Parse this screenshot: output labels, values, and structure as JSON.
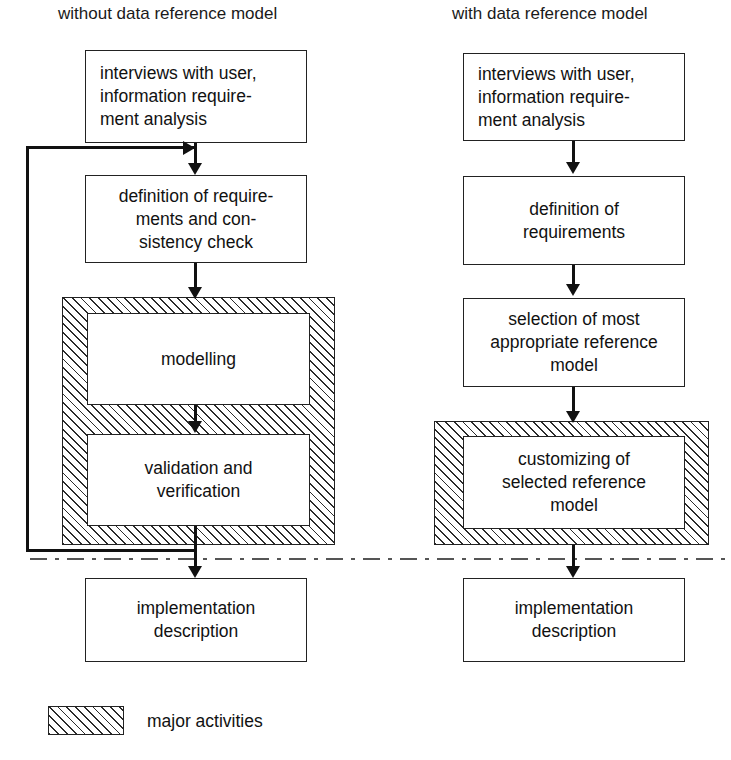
{
  "diagram": {
    "title_left": "without data reference model",
    "title_right": "with data reference model",
    "legend": {
      "swatch_name": "hatched-pattern-swatch",
      "label": "major activities"
    },
    "columns": [
      {
        "id": "without-data-reference-model",
        "header": "without data reference model",
        "nodes": [
          {
            "id": "interviews",
            "label": "interviews with user,\ninformation require-\nment analysis",
            "highlighted": false
          },
          {
            "id": "definition",
            "label": "definition of require-\nments and con-\nsistency check",
            "highlighted": false
          },
          {
            "id": "modelling",
            "label": "modelling",
            "highlighted": true
          },
          {
            "id": "validation",
            "label": "validation and\nverification",
            "highlighted": true
          },
          {
            "id": "implementation",
            "label": "implementation\ndescription",
            "highlighted": false
          }
        ],
        "feedback_loop": {
          "from": "validation",
          "to": "definition",
          "label": ""
        }
      },
      {
        "id": "with-data-reference-model",
        "header": "with data reference model",
        "nodes": [
          {
            "id": "interviews",
            "label": "interviews with user,\ninformation require-\nment analysis",
            "highlighted": false
          },
          {
            "id": "definition",
            "label": "definition of\nrequirements",
            "highlighted": false
          },
          {
            "id": "selection",
            "label": "selection of most\nappropriate reference\nmodel",
            "highlighted": false
          },
          {
            "id": "customizing",
            "label": "customizing of\nselected reference\nmodel",
            "highlighted": true
          },
          {
            "id": "implementation",
            "label": "implementation\ndescription",
            "highlighted": false
          }
        ]
      }
    ],
    "text": {
      "l_interviews_1": "interviews with user,",
      "l_interviews_2": "information require-",
      "l_interviews_3": "ment analysis",
      "l_definition_1": "definition of require-",
      "l_definition_2": "ments and con-",
      "l_definition_3": "sistency check",
      "l_modelling_1": "modelling",
      "l_validation_1": "validation and",
      "l_validation_2": "verification",
      "l_implementation_1": "implementation",
      "l_implementation_2": "description",
      "r_interviews_1": "interviews with user,",
      "r_interviews_2": "information require-",
      "r_interviews_3": "ment analysis",
      "r_definition_1": "definition of",
      "r_definition_2": "requirements",
      "r_selection_1": "selection of most",
      "r_selection_2": "appropriate reference",
      "r_selection_3": "model",
      "r_customizing_1": "customizing of",
      "r_customizing_2": "selected reference",
      "r_customizing_3": "model",
      "r_implementation_1": "implementation",
      "r_implementation_2": "description"
    },
    "colors": {
      "stroke": "#222222",
      "text": "#111111",
      "hatch": "#2b2b2b",
      "separator": "#555555",
      "background": "#ffffff"
    }
  }
}
